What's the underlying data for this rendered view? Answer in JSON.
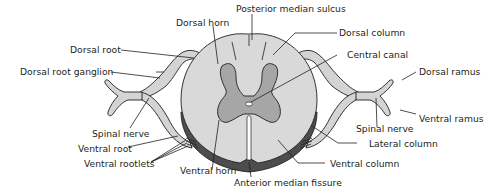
{
  "colors": {
    "white_matter": "#d9d9d9",
    "gray_matter": "#a6a6a6",
    "pia_edge": "#4d4d4d",
    "nerve": "#d4d4d4",
    "outline": "#231f20",
    "background": "#ffffff"
  },
  "labels": {
    "posterior_median_sulcus": "Posterior median sulcus",
    "dorsal_horn": "Dorsal horn",
    "dorsal_column": "Dorsal column",
    "dorsal_root": "Dorsal root",
    "central_canal": "Central canal",
    "dorsal_root_ganglion": "Dorsal root ganglion",
    "dorsal_ramus": "Dorsal ramus",
    "ventral_ramus": "Ventral ramus",
    "spinal_nerve_left": "Spinal nerve",
    "spinal_nerve_right": "Spinal nerve",
    "lateral_column": "Lateral column",
    "ventral_root": "Ventral root",
    "ventral_rootlets": "Ventral rootlets",
    "ventral_column": "Ventral column",
    "ventral_horn": "Ventral horn",
    "anterior_median_fissure": "Anterior median fissure"
  }
}
